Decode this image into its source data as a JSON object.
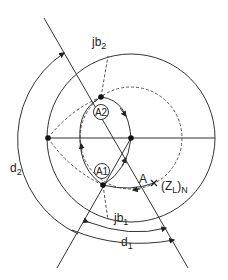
{
  "diagram": {
    "type": "smith-chart-double-stub-matching",
    "colors": {
      "stroke": "#333333",
      "text": "#222222",
      "background": "#ffffff"
    },
    "labels": {
      "jb2": {
        "main": "jb",
        "sub": "2"
      },
      "jb1": {
        "main": "jb",
        "sub": "1"
      },
      "d1": {
        "main": "d",
        "sub": "1"
      },
      "d2": {
        "main": "d",
        "sub": "2"
      },
      "A": "A",
      "zl_open": "(Z",
      "zl_sub": "L",
      "zl_close": ")",
      "zl_sub2": "N",
      "A1": "A1",
      "A2": "A2"
    },
    "points": [
      {
        "name": "chart-center",
        "x": 131,
        "y": 138
      },
      {
        "name": "left-short-point",
        "x": 48,
        "y": 138
      },
      {
        "name": "point-a2",
        "x": 101,
        "y": 97
      },
      {
        "name": "point-a1",
        "x": 103,
        "y": 185
      },
      {
        "name": "load-point-a",
        "x": 154,
        "y": 183
      }
    ]
  }
}
